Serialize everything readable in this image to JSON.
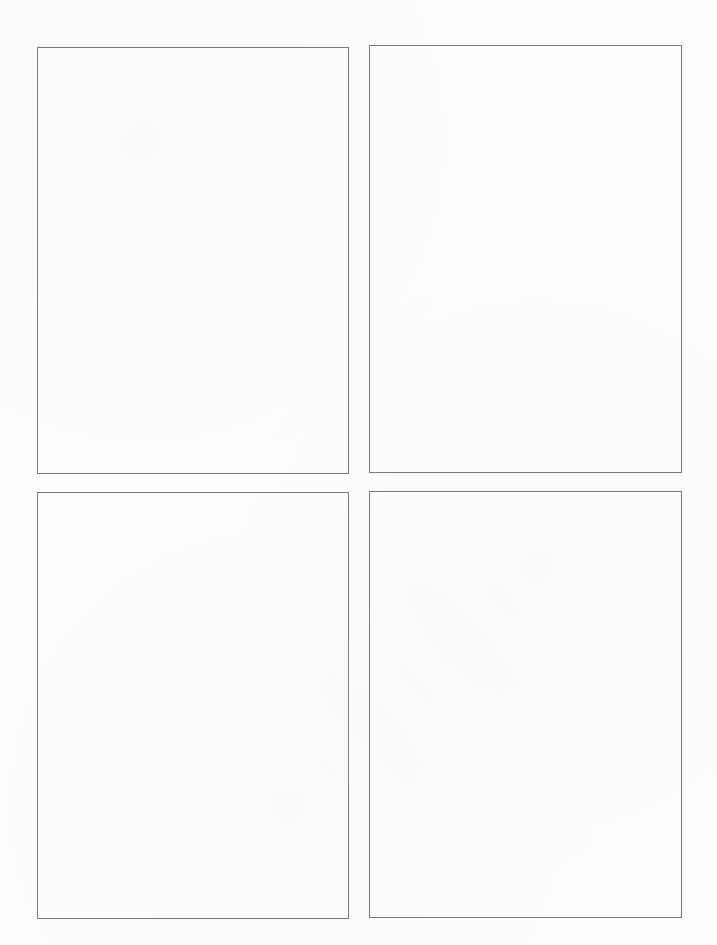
{
  "page": {
    "type": "blank-frame-template",
    "background_color": "#fdfdfd",
    "frame_border_color": "#7a7a7a",
    "frames": [
      {
        "id": "top-left",
        "left": 37,
        "top": 47,
        "width": 312,
        "height": 427,
        "content": ""
      },
      {
        "id": "top-right",
        "left": 369,
        "top": 45,
        "width": 313,
        "height": 428,
        "content": ""
      },
      {
        "id": "bottom-left",
        "left": 37,
        "top": 492,
        "width": 312,
        "height": 427,
        "content": ""
      },
      {
        "id": "bottom-right",
        "left": 369,
        "top": 491,
        "width": 313,
        "height": 427,
        "content": ""
      }
    ]
  }
}
